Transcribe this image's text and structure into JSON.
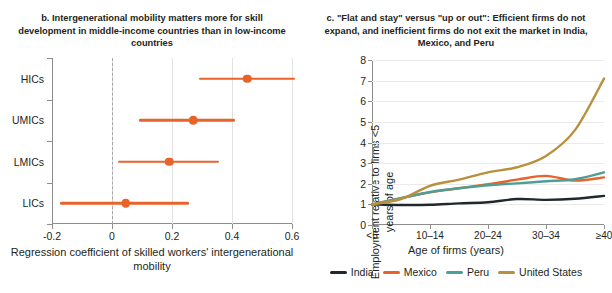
{
  "panel_b": {
    "title": "b. Intergenerational mobility matters more for skill development in middle-income countries than in low-income countries",
    "axis_caption": "Regression coefficient of skilled workers' intergenerational mobility",
    "accent_color": "#E8632A",
    "chart_data": {
      "type": "scatter",
      "title": "b. Intergenerational mobility matters more for skill development in middle-income countries than in low-income countries",
      "xlabel": "Regression coefficient of skilled workers' intergenerational mobility",
      "ylabel": "",
      "xlim": [
        -0.2,
        0.6
      ],
      "xticks": [
        -0.2,
        0,
        0.2,
        0.4,
        0.6
      ],
      "xticklabels": [
        "-0.2",
        "0",
        "0.2",
        "0.4",
        "0.6"
      ],
      "categories": [
        "HICs",
        "UMICs",
        "LMICs",
        "LICs"
      ],
      "grid": "vertical",
      "reference_line": 0,
      "points": [
        {
          "category": "HICs",
          "estimate": 0.45,
          "low": 0.29,
          "high": 0.61
        },
        {
          "category": "UMICs",
          "estimate": 0.27,
          "low": 0.09,
          "high": 0.41
        },
        {
          "category": "LMICs",
          "estimate": 0.19,
          "low": 0.02,
          "high": 0.355
        },
        {
          "category": "LICs",
          "estimate": 0.045,
          "low": -0.175,
          "high": 0.255
        }
      ]
    }
  },
  "panel_c": {
    "title": "c. \"Flat and stay\" versus \"up or out\": Efficient firms do not expand, and inefficient firms do not exit the market in India, Mexico, and Peru",
    "yaxis_title": "Employment relative to firms <5 years of age",
    "xaxis_title": "Age of firms (years)",
    "chart_data": {
      "type": "line",
      "title": "c. \"Flat and stay\" versus \"up or out\": Efficient firms do not expand, and inefficient firms do not exit the market in India, Mexico, and Peru",
      "xlabel": "Age of firms (years)",
      "ylabel": "Employment relative to firms <5 years of age",
      "ylim": [
        0,
        8
      ],
      "yticks": [
        0,
        1,
        2,
        3,
        4,
        5,
        6,
        7,
        8
      ],
      "yticklabels": [
        "0",
        "1",
        "2",
        "3",
        "4",
        "5",
        "6",
        "7",
        "8"
      ],
      "x": [
        "<5",
        "5-9",
        "10-14",
        "15-19",
        "20-24",
        "25-29",
        "30-34",
        "35-39",
        ">=40"
      ],
      "xticks": [
        "<5",
        "10-14",
        "20-24",
        "30-34",
        "≥40"
      ],
      "xticklabels": [
        "<5",
        "10–14",
        "20–24",
        "30–34",
        "≥40"
      ],
      "grid": "horizontal",
      "legend_position": "bottom",
      "series": [
        {
          "name": "India",
          "color": "#20282E",
          "values": [
            1.0,
            0.97,
            0.98,
            1.05,
            1.1,
            1.26,
            1.22,
            1.27,
            1.41
          ]
        },
        {
          "name": "Mexico",
          "color": "#E8632A",
          "values": [
            1.0,
            1.3,
            1.58,
            1.78,
            1.98,
            2.2,
            2.38,
            2.15,
            2.31
          ]
        },
        {
          "name": "Peru",
          "color": "#4F9E96",
          "values": [
            1.0,
            1.3,
            1.6,
            1.78,
            1.93,
            2.02,
            2.12,
            2.22,
            2.55
          ]
        },
        {
          "name": "United States",
          "color": "#B8913D",
          "values": [
            1.0,
            1.26,
            1.9,
            2.2,
            2.55,
            2.8,
            3.35,
            4.6,
            7.1
          ]
        }
      ]
    },
    "legend": [
      {
        "label": "India",
        "color": "#20282E"
      },
      {
        "label": "Mexico",
        "color": "#E8632A"
      },
      {
        "label": "Peru",
        "color": "#4F9E96"
      },
      {
        "label": "United States",
        "color": "#B8913D"
      }
    ]
  }
}
